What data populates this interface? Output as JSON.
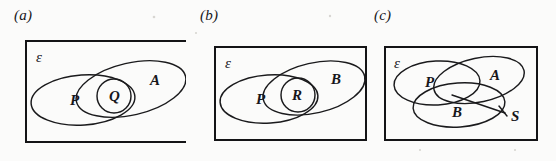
{
  "figure": {
    "kind": "venn-diagram-set",
    "background_color": "#fbfbfa",
    "ink_color": "#1a1a1c",
    "universe_symbol": "ε"
  },
  "panels": [
    {
      "id": "a",
      "caption": "(a)",
      "universe_label": "ε",
      "sets": [
        {
          "name": "P",
          "label": "P",
          "shape": "ellipse",
          "role": "left-large-set"
        },
        {
          "name": "A",
          "label": "A",
          "shape": "ellipse",
          "role": "right-tilted-set"
        },
        {
          "name": "Q",
          "label": "Q",
          "shape": "small-circle",
          "role": "intersection-set"
        }
      ],
      "relationship": "Q straddles the overlap of P and A"
    },
    {
      "id": "b",
      "caption": "(b)",
      "universe_label": "ε",
      "sets": [
        {
          "name": "P",
          "label": "P",
          "shape": "ellipse",
          "role": "left-large-set"
        },
        {
          "name": "B",
          "label": "B",
          "shape": "ellipse",
          "role": "right-tilted-set"
        },
        {
          "name": "R",
          "label": "R",
          "shape": "small-circle",
          "role": "intersection-set"
        }
      ],
      "relationship": "R straddles the overlap of P and B"
    },
    {
      "id": "c",
      "caption": "(c)",
      "universe_label": "ε",
      "sets": [
        {
          "name": "P",
          "label": "P",
          "shape": "ellipse",
          "role": "upper-left-set"
        },
        {
          "name": "A",
          "label": "A",
          "shape": "ellipse",
          "role": "upper-right-tilted-set"
        },
        {
          "name": "B",
          "label": "B",
          "shape": "ellipse",
          "role": "lower-set"
        },
        {
          "name": "S",
          "label": "S",
          "shape": "leader-line-label",
          "role": "triple-intersection-callout"
        }
      ],
      "relationship": "S labels the central region where P, A and B all overlap"
    }
  ]
}
